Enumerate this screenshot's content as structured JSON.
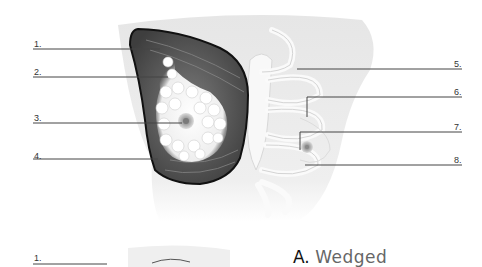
{
  "figure": {
    "type": "anatomical-diagram",
    "labels": [
      {
        "id": 1,
        "text": "1."
      },
      {
        "id": 2,
        "text": "2."
      },
      {
        "id": 3,
        "text": "3."
      },
      {
        "id": 4,
        "text": "4."
      },
      {
        "id": 5,
        "text": "5."
      },
      {
        "id": 6,
        "text": "6."
      },
      {
        "id": 7,
        "text": "7."
      },
      {
        "id": 8,
        "text": "8."
      }
    ]
  },
  "bottom": {
    "label_1": "1.",
    "caption_letter": "A.",
    "caption_word": "Wedged"
  }
}
